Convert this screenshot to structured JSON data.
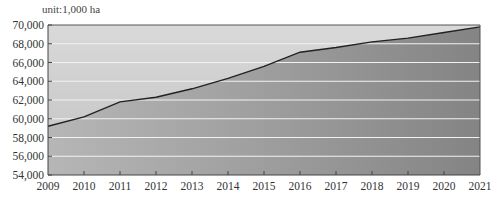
{
  "chart_data": {
    "type": "area",
    "title": "",
    "unit_label": "unit:1,000 ha",
    "xlabel": "",
    "ylabel": "",
    "x": [
      "2009",
      "2010",
      "2011",
      "2012",
      "2013",
      "2014",
      "2015",
      "2016",
      "2017",
      "2018",
      "2019",
      "2020",
      "2021"
    ],
    "series": [
      {
        "name": "Area",
        "values": [
          59200,
          60200,
          61800,
          62300,
          63200,
          64300,
          65600,
          67100,
          67600,
          68200,
          68600,
          69200,
          69800
        ]
      }
    ],
    "ylim": [
      54000,
      70000
    ],
    "yticks": [
      "70,000",
      "68,000",
      "66,000",
      "64,000",
      "62,000",
      "60,000",
      "58,000",
      "56,000",
      "54,000"
    ],
    "grid": true,
    "legend": "none",
    "colors": {
      "background_top": "#d8d8d8",
      "background_bottom": "#c4c4c4",
      "fill_left": "#b4b4b4",
      "fill_right": "#858585",
      "line": "#222222",
      "grid": "#f2f2f2",
      "axis": "#444444"
    }
  }
}
